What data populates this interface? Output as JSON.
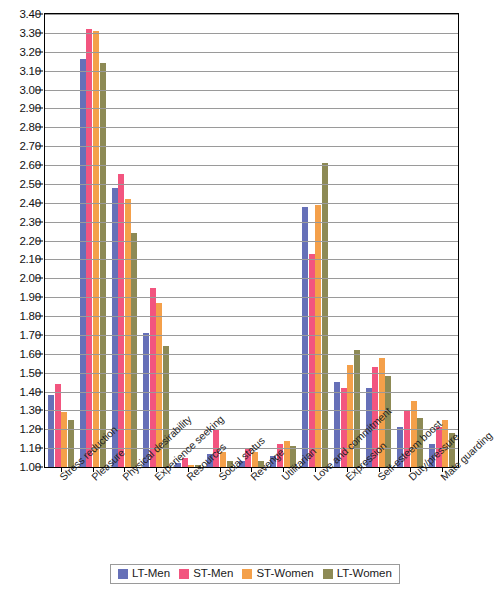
{
  "chart_data": {
    "type": "bar",
    "title": "",
    "xlabel": "",
    "ylabel": "",
    "ylim": [
      1.0,
      3.4
    ],
    "ytick_step": 0.1,
    "grid": true,
    "legend_position": "bottom",
    "ytick_labels": [
      "3.40",
      "3.30",
      "3.20",
      "3.10",
      "3.00",
      "2.90",
      "2.80",
      "2.70",
      "2.60",
      "2.50",
      "2.40",
      "2.30",
      "2.20",
      "2.10",
      "2.00",
      "1.90",
      "1.80",
      "1.70",
      "1.60",
      "1.50",
      "1.40",
      "1.30",
      "1.20",
      "1.10",
      "1.00"
    ],
    "categories": [
      "Stress reduction",
      "Pleasure",
      "Physical desirability",
      "Experience seeking",
      "Resources",
      "Social status",
      "Revenge",
      "Utilitarian",
      "Love and commitment",
      "Expression",
      "Self-esteem boost",
      "Duty/pressure",
      "Mate guarding"
    ],
    "series": [
      {
        "name": "LT-Men",
        "color": "#6670b8",
        "values": [
          1.38,
          3.16,
          2.48,
          1.71,
          1.02,
          1.07,
          1.03,
          1.06,
          2.38,
          1.45,
          1.42,
          1.21,
          1.12
        ]
      },
      {
        "name": "ST-Men",
        "color": "#f2557f",
        "values": [
          1.44,
          3.32,
          2.55,
          1.95,
          1.05,
          1.2,
          1.1,
          1.12,
          2.13,
          1.42,
          1.53,
          1.3,
          1.21
        ]
      },
      {
        "name": "ST-Women",
        "color": "#f4a04a",
        "values": [
          1.29,
          3.31,
          2.42,
          1.87,
          1.01,
          1.08,
          1.08,
          1.14,
          2.39,
          1.54,
          1.58,
          1.35,
          1.25
        ]
      },
      {
        "name": "LT-Women",
        "color": "#8d8a55",
        "values": [
          1.25,
          3.14,
          2.24,
          1.64,
          1.01,
          1.03,
          1.03,
          1.11,
          2.61,
          1.62,
          1.48,
          1.26,
          1.18
        ]
      }
    ]
  }
}
